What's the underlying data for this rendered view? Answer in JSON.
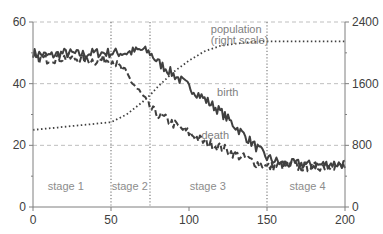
{
  "chart_data": {
    "type": "line",
    "title": "",
    "xlabel": "",
    "ylabel": "",
    "y2label": "",
    "xlim": [
      0,
      200
    ],
    "ylim": [
      0,
      60
    ],
    "y2lim": [
      0,
      2400
    ],
    "x_ticks": [
      0,
      50,
      100,
      150,
      200
    ],
    "y_ticks": [
      0,
      20,
      40,
      60
    ],
    "y2_ticks": [
      0,
      800,
      1600,
      2400
    ],
    "grid": {
      "horizontal": true,
      "style": "dashed"
    },
    "legend": "none (inline labels)",
    "stage_boundaries": [
      50,
      75,
      150
    ],
    "stages": [
      {
        "label": "stage 1",
        "x": 21
      },
      {
        "label": "stage 2",
        "x": 62
      },
      {
        "label": "stage 3",
        "x": 112
      },
      {
        "label": "stage 4",
        "x": 176
      }
    ],
    "annotations": [
      {
        "text": "birth",
        "x": 118,
        "y": 36
      },
      {
        "text": "death",
        "x": 108,
        "y": 22
      },
      {
        "text": "population",
        "x": 114,
        "y": 56.5
      },
      {
        "text": "(right scale)",
        "x": 114,
        "y": 52.8
      }
    ],
    "series": [
      {
        "name": "birth",
        "axis": "left",
        "style": "solid",
        "x": [
          0,
          10,
          20,
          30,
          40,
          50,
          60,
          70,
          75,
          80,
          90,
          100,
          110,
          120,
          130,
          140,
          150,
          160,
          170,
          180,
          190,
          200
        ],
        "values": [
          50,
          49,
          50,
          49.5,
          50,
          50,
          50,
          51,
          50,
          47,
          43,
          39,
          35,
          31,
          26,
          21,
          16,
          14,
          14,
          13.5,
          14,
          14
        ]
      },
      {
        "name": "death",
        "axis": "left",
        "style": "dashed",
        "x": [
          0,
          10,
          20,
          30,
          40,
          50,
          60,
          70,
          75,
          80,
          90,
          100,
          110,
          120,
          130,
          140,
          150,
          160,
          170,
          180,
          190,
          200
        ],
        "values": [
          48,
          48,
          48.5,
          48,
          47.5,
          48,
          43,
          36,
          32,
          30,
          27,
          24,
          21,
          19.5,
          17,
          15,
          13,
          13.5,
          13,
          13,
          13.5,
          13
        ]
      },
      {
        "name": "population (right scale)",
        "axis": "right",
        "style": "dotted",
        "x": [
          0,
          10,
          20,
          30,
          40,
          50,
          60,
          70,
          75,
          80,
          90,
          100,
          110,
          120,
          130,
          140,
          150,
          160,
          170,
          180,
          190,
          200
        ],
        "values": [
          1000,
          1020,
          1040,
          1060,
          1080,
          1100,
          1200,
          1360,
          1450,
          1560,
          1750,
          1900,
          2020,
          2090,
          2120,
          2140,
          2150,
          2150,
          2150,
          2150,
          2150,
          2150
        ]
      }
    ]
  },
  "colors": {
    "line": "#404040",
    "grid": "#bfbfbf",
    "axis": "#7f7f7f",
    "stage_divider": "#7f7f7f"
  }
}
